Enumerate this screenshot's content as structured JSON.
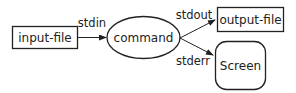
{
  "diagram": {
    "nodes": {
      "input": {
        "label": "input-file",
        "shape": "rectangle"
      },
      "command": {
        "label": "command",
        "shape": "ellipse"
      },
      "output": {
        "label": "output-file",
        "shape": "rectangle"
      },
      "screen": {
        "label": "Screen",
        "shape": "rounded-rectangle"
      }
    },
    "edges": {
      "stdin": {
        "label": "stdin",
        "from": "input-file",
        "to": "command"
      },
      "stdout": {
        "label": "stdout",
        "from": "command",
        "to": "output-file"
      },
      "stderr": {
        "label": "stderr",
        "from": "command",
        "to": "Screen"
      }
    },
    "colors": {
      "stroke": "#222222",
      "background": "#ffffff"
    }
  }
}
